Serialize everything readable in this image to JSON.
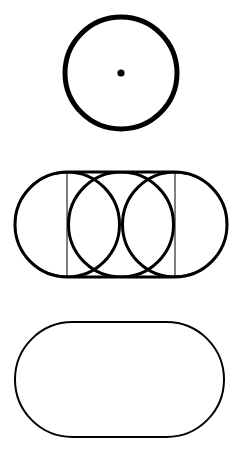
{
  "canvas": {
    "width": 241,
    "height": 455,
    "background_color": "#ffffff",
    "stroke_color": "#000000"
  },
  "figures": [
    {
      "id": "circle-with-center-dot",
      "label": "Circle with center point",
      "type": "circle",
      "cx": 121,
      "cy": 73,
      "r": 56,
      "stroke_width": 5,
      "fill": "none",
      "center_dot": {
        "cx": 121,
        "cy": 73,
        "r": 3.6,
        "fill": "#000000"
      }
    },
    {
      "id": "stadium-with-three-circles",
      "label": "Stadium with three overlapping circles and two chords",
      "type": "composite",
      "bounds": {
        "x": 15,
        "y": 172,
        "width": 212,
        "height": 105
      },
      "outline": {
        "type": "stadium",
        "x": 15,
        "y": 172,
        "width": 212,
        "height": 105,
        "radius": 52.5,
        "stroke_width": 3,
        "fill": "none"
      },
      "circles": [
        {
          "cx": 67,
          "cy": 224.5,
          "r": 52.5,
          "stroke_width": 3,
          "fill": "none"
        },
        {
          "cx": 121,
          "cy": 224.5,
          "r": 52.5,
          "stroke_width": 3,
          "fill": "none"
        },
        {
          "cx": 175,
          "cy": 224.5,
          "r": 52.5,
          "stroke_width": 3,
          "fill": "none"
        }
      ],
      "chords": [
        {
          "x1": 67,
          "y1": 172,
          "x2": 67,
          "y2": 277,
          "stroke_width": 1
        },
        {
          "x1": 175,
          "y1": 172,
          "x2": 175,
          "y2": 277,
          "stroke_width": 1
        }
      ]
    },
    {
      "id": "stadium-outline",
      "label": "Stadium outline",
      "type": "stadium",
      "x": 15,
      "y": 322,
      "width": 209,
      "height": 115,
      "radius": 57.5,
      "stroke_width": 2,
      "fill": "none"
    }
  ]
}
